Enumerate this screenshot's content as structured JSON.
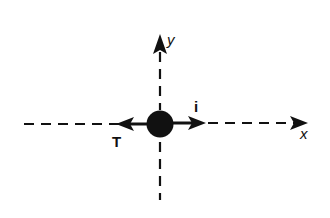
{
  "diagram": {
    "title": "",
    "axes": {
      "x_label": "x",
      "y_label": "y"
    },
    "vectors": [
      {
        "label": "T",
        "direction": "negative-x"
      },
      {
        "label": "i",
        "direction": "positive-x"
      }
    ],
    "body": {
      "shape": "filled-circle",
      "color": "#111111"
    },
    "colors": {
      "ink": "#111111",
      "background": "#ffffff"
    }
  }
}
